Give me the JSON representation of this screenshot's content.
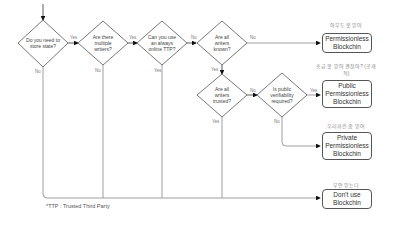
{
  "decisions": [
    {
      "id": "store_state",
      "text": "Do you need to store state?"
    },
    {
      "id": "multiple_writers",
      "text": "Are there multiple writers?"
    },
    {
      "id": "ttp",
      "text": "Can you use an always online TTP?"
    },
    {
      "id": "writers_known",
      "text": "Are all writers known?"
    },
    {
      "id": "writers_trusted",
      "text": "Are all writers trusted?"
    },
    {
      "id": "public_verifiability",
      "text": "Is public verifiability required?"
    }
  ],
  "edge_labels": {
    "yes": "Yes",
    "no": "No"
  },
  "outcomes": [
    {
      "id": "permissionless",
      "caption": "아무도 못 믿어",
      "text": "Permissionless Blockchin"
    },
    {
      "id": "public_permissioned",
      "caption": "조금 못 믿어 괜찮아? (공개적)",
      "text": "Public Permissionless Blockchin"
    },
    {
      "id": "private_permissioned",
      "caption": "우리끼린 좀 믿어",
      "text": "Private Permissionless Blockchin"
    },
    {
      "id": "no_blockchain",
      "caption": "무언 믿는다",
      "text": "Don't use Blockchin"
    }
  ],
  "footnote": "*TTP : Trusted Third Party"
}
